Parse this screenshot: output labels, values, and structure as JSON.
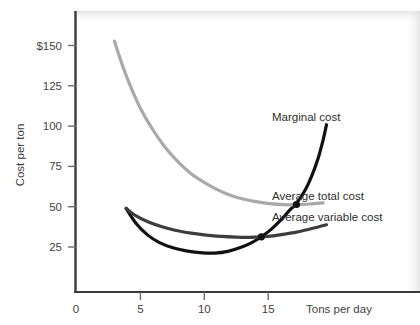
{
  "chart_data": {
    "type": "line",
    "title": "",
    "xlabel": "Tons per day",
    "ylabel": "Cost per ton",
    "xlim": [
      0,
      20.6
    ],
    "ylim": [
      0,
      168
    ],
    "grid": false,
    "legend_position": "inline-right-labels",
    "xticks": [
      {
        "value": 0,
        "label": "0"
      },
      {
        "value": 5,
        "label": "5"
      },
      {
        "value": 10,
        "label": "10"
      },
      {
        "value": 15,
        "label": "15"
      }
    ],
    "yticks": [
      {
        "value": 25,
        "label": "25"
      },
      {
        "value": 50,
        "label": "50"
      },
      {
        "value": 75,
        "label": "75"
      },
      {
        "value": 100,
        "label": "100"
      },
      {
        "value": 125,
        "label": "125"
      },
      {
        "value": 150,
        "label": "$150"
      }
    ],
    "series": [
      {
        "name": "Marginal cost",
        "label": "Marginal cost",
        "color": "#111111",
        "width": 3.2,
        "points": [
          [
            3.0,
            50.0
          ],
          [
            3.6,
            41.0
          ],
          [
            4.3,
            34.0
          ],
          [
            5.0,
            29.5
          ],
          [
            5.8,
            26.4
          ],
          [
            6.6,
            24.6
          ],
          [
            7.4,
            23.6
          ],
          [
            8.3,
            23.3
          ],
          [
            9.1,
            24.3
          ],
          [
            9.8,
            26.4
          ],
          [
            10.5,
            29.4
          ],
          [
            11.1,
            33.0
          ],
          [
            11.7,
            37.6
          ],
          [
            12.3,
            43.4
          ],
          [
            12.8,
            49.0
          ],
          [
            13.2,
            53.0
          ],
          [
            13.7,
            60.5
          ],
          [
            14.1,
            69.0
          ],
          [
            14.5,
            80.0
          ],
          [
            14.8,
            91.0
          ],
          [
            15.0,
            100.0
          ]
        ]
      },
      {
        "name": "Average total cost",
        "label": "Average total cost",
        "color": "#a9a9a9",
        "width": 3.2,
        "points": [
          [
            2.3,
            150.0
          ],
          [
            2.8,
            135.0
          ],
          [
            3.3,
            122.0
          ],
          [
            3.9,
            109.0
          ],
          [
            4.6,
            97.0
          ],
          [
            5.3,
            87.0
          ],
          [
            6.0,
            79.0
          ],
          [
            6.8,
            71.5
          ],
          [
            7.6,
            66.0
          ],
          [
            8.4,
            61.5
          ],
          [
            9.2,
            58.0
          ],
          [
            10.0,
            55.6
          ],
          [
            10.8,
            54.0
          ],
          [
            11.6,
            52.8
          ],
          [
            12.4,
            52.2
          ],
          [
            13.2,
            52.2
          ],
          [
            14.0,
            52.6
          ],
          [
            14.8,
            53.3
          ]
        ]
      },
      {
        "name": "Average variable cost",
        "label": "Average variable cost",
        "color": "#3d3d3d",
        "width": 3.2,
        "points": [
          [
            3.0,
            50.0
          ],
          [
            3.6,
            45.5
          ],
          [
            4.3,
            42.0
          ],
          [
            5.1,
            39.2
          ],
          [
            6.0,
            36.8
          ],
          [
            6.9,
            35.2
          ],
          [
            7.8,
            34.0
          ],
          [
            8.7,
            33.2
          ],
          [
            9.6,
            32.8
          ],
          [
            10.4,
            32.7
          ],
          [
            11.1,
            33.0
          ],
          [
            11.8,
            33.6
          ],
          [
            12.5,
            34.6
          ],
          [
            13.2,
            35.8
          ],
          [
            13.9,
            37.4
          ],
          [
            14.5,
            38.9
          ],
          [
            15.0,
            40.2
          ]
        ]
      }
    ],
    "markers": [
      {
        "name": "mc-crosses-avc-minimum",
        "x": 11.1,
        "y": 33.0,
        "color": "#111111",
        "radius": 3.6
      },
      {
        "name": "mc-crosses-atc-minimum",
        "x": 13.2,
        "y": 52.3,
        "color": "#111111",
        "radius": 3.6
      }
    ],
    "curve_labels": [
      {
        "name": "marginal-cost-label",
        "text": "Marginal cost",
        "x": 272,
        "y": 121
      },
      {
        "name": "average-total-cost-label",
        "text": "Average total cost",
        "x": 272,
        "y": 200
      },
      {
        "name": "average-variable-cost-label",
        "text": "Average variable cost",
        "x": 272,
        "y": 221
      }
    ]
  },
  "axes": {
    "y_title": "Cost per ton",
    "x_title": "Tons per day"
  },
  "colors": {
    "marginal_cost": "#111111",
    "average_total_cost": "#a9a9a9",
    "average_variable_cost": "#3d3d3d",
    "axis": "#3a3a3a",
    "background": "#ffffff"
  }
}
